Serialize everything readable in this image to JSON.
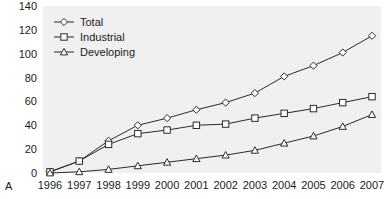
{
  "panel_label": "A",
  "chart_data": {
    "type": "line",
    "title": "",
    "subtitle": "",
    "xlabel": "",
    "ylabel": "",
    "categories": [
      "1996",
      "1997",
      "1998",
      "1999",
      "2000",
      "2001",
      "2002",
      "2003",
      "2004",
      "2005",
      "2006",
      "2007"
    ],
    "xlim": [
      1996,
      2007
    ],
    "ylim": [
      0,
      140
    ],
    "yticks": [
      0,
      20,
      40,
      60,
      80,
      100,
      120,
      140
    ],
    "ytick_labels": [
      "0",
      "20",
      "40",
      "60",
      "80",
      "100",
      "120",
      "140"
    ],
    "grid": false,
    "legend_position": "top-left",
    "series": [
      {
        "name": "Total",
        "marker": "diamond",
        "values": [
          1,
          10,
          27,
          40,
          46,
          53,
          59,
          67,
          81,
          90,
          101,
          115
        ]
      },
      {
        "name": "Industrial",
        "marker": "square",
        "values": [
          1,
          10,
          24,
          33,
          36,
          40,
          41,
          46,
          50,
          54,
          59,
          64
        ]
      },
      {
        "name": "Developing",
        "marker": "triangle",
        "values": [
          0,
          1,
          3,
          6,
          9,
          12,
          15,
          19,
          25,
          31,
          39,
          49
        ]
      }
    ],
    "colors": {
      "line": "#2b2b2b",
      "marker_fill": "#ffffff",
      "plot_background": "#f0f0f0",
      "text": "#1a1a1a"
    }
  }
}
